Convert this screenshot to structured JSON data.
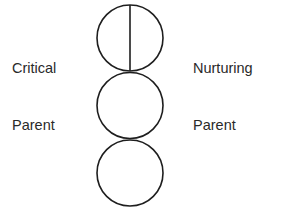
{
  "diagram": {
    "labels": {
      "left": {
        "line1": "Critical",
        "line2": "Parent"
      },
      "right": {
        "line1": "Nurturing",
        "line2": "Parent"
      }
    },
    "circles": [
      {
        "name": "parent",
        "cx": 130,
        "cy": 38,
        "r": 33,
        "divided": true
      },
      {
        "name": "adult",
        "cx": 130,
        "cy": 105.5,
        "r": 33,
        "divided": false
      },
      {
        "name": "child",
        "cx": 130,
        "cy": 173,
        "r": 33,
        "divided": false
      }
    ],
    "stroke_color": "#1e1e1e"
  }
}
